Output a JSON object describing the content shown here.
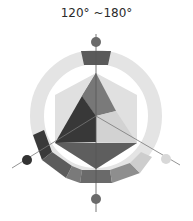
{
  "title": "120° ~180°",
  "diagram": {
    "type": "hue-wheel",
    "center": [
      96,
      116
    ],
    "ring": {
      "outer_r": 66,
      "inner_r": 52
    },
    "highlighted_segment": "top",
    "colors": {
      "ring_light": "#e2e2e2",
      "ring_mid": "#c8c8c8",
      "ring_dark": "#555555",
      "ring_darker": "#3a3a3a",
      "ring_grey": "#7a7a7a",
      "hex_light": "#dcdcdc",
      "tri_mid": "#6e6e6e",
      "tri_dark": "#353535",
      "tri_light": "#cfcfcf",
      "tri_bottom": "#585858",
      "dot_top": "#6a6a6a",
      "dot_left": "#333333",
      "dot_right": "#d8d8d8",
      "dot_bottom": "#6a6a6a"
    },
    "axes": [
      {
        "name": "top",
        "dot": [
          96,
          42
        ]
      },
      {
        "name": "bottom",
        "dot": [
          96,
          199
        ]
      },
      {
        "name": "left",
        "dot": [
          27,
          160
        ]
      },
      {
        "name": "right",
        "dot": [
          166,
          159
        ]
      }
    ]
  }
}
